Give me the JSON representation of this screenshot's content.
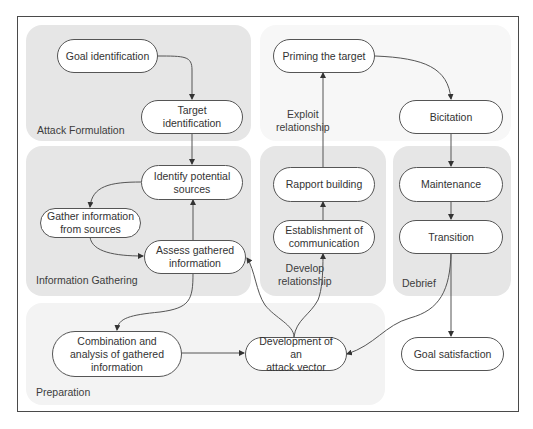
{
  "diagram": {
    "panels": {
      "attack_formulation": "Attack Formulation",
      "information_gathering": "Information Gathering",
      "develop_relationship": "Develop\nrelationship",
      "develop_relationship_line1": "Develop",
      "develop_relationship_line2": "relationship",
      "debrief": "Debrief",
      "preparation": "Preparation"
    },
    "edge_labels": {
      "exploit_relationship_line1": "Exploit",
      "exploit_relationship_line2": "relationship"
    },
    "nodes": {
      "goal_identification": {
        "line1": "Goal identification"
      },
      "target_identification": {
        "line1": "Target identification"
      },
      "identify_potential_sources": {
        "line1": "Identify potential",
        "line2": "sources"
      },
      "gather_information": {
        "line1": "Gather information",
        "line2": "from sources"
      },
      "assess_gathered": {
        "line1": "Assess gathered",
        "line2": "information"
      },
      "priming_target": {
        "line1": "Priming the target"
      },
      "bicitation": {
        "line1": "Bicitation"
      },
      "rapport_building": {
        "line1": "Rapport building"
      },
      "establishment_communication": {
        "line1": "Establishment of",
        "line2": "communication"
      },
      "maintenance": {
        "line1": "Maintenance"
      },
      "transition": {
        "line1": "Transition"
      },
      "combination_analysis": {
        "line1": "Combination and",
        "line2": "analysis of gathered",
        "line3": "information"
      },
      "development_attack_vector": {
        "line1": "Development of an",
        "line2": "attack vector"
      },
      "goal_satisfaction": {
        "line1": "Goal satisfaction"
      }
    },
    "edges": [
      {
        "from": "Goal identification",
        "to": "Target identification"
      },
      {
        "from": "Target identification",
        "to": "Identify potential sources"
      },
      {
        "from": "Identify potential sources",
        "to": "Gather information from sources"
      },
      {
        "from": "Gather information from sources",
        "to": "Assess gathered information"
      },
      {
        "from": "Assess gathered information",
        "to": "Identify potential sources"
      },
      {
        "from": "Assess gathered information",
        "to": "Combination and analysis of gathered information"
      },
      {
        "from": "Combination and analysis of gathered information",
        "to": "Development of an attack vector"
      },
      {
        "from": "Development of an attack vector",
        "to": "Assess gathered information"
      },
      {
        "from": "Development of an attack vector",
        "to": "Establishment of communication"
      },
      {
        "from": "Establishment of communication",
        "to": "Rapport building"
      },
      {
        "from": "Rapport building",
        "to": "Priming the target",
        "label": "Exploit relationship"
      },
      {
        "from": "Priming the target",
        "to": "Bicitation"
      },
      {
        "from": "Bicitation",
        "to": "Maintenance"
      },
      {
        "from": "Maintenance",
        "to": "Transition"
      },
      {
        "from": "Transition",
        "to": "Goal satisfaction"
      },
      {
        "from": "Transition",
        "to": "Development of an attack vector"
      }
    ],
    "colors": {
      "panel_dark": "#e6e6e6",
      "panel_light": "#f3f3f3",
      "stroke": "#555555",
      "frame": "#4a4a4a"
    }
  }
}
